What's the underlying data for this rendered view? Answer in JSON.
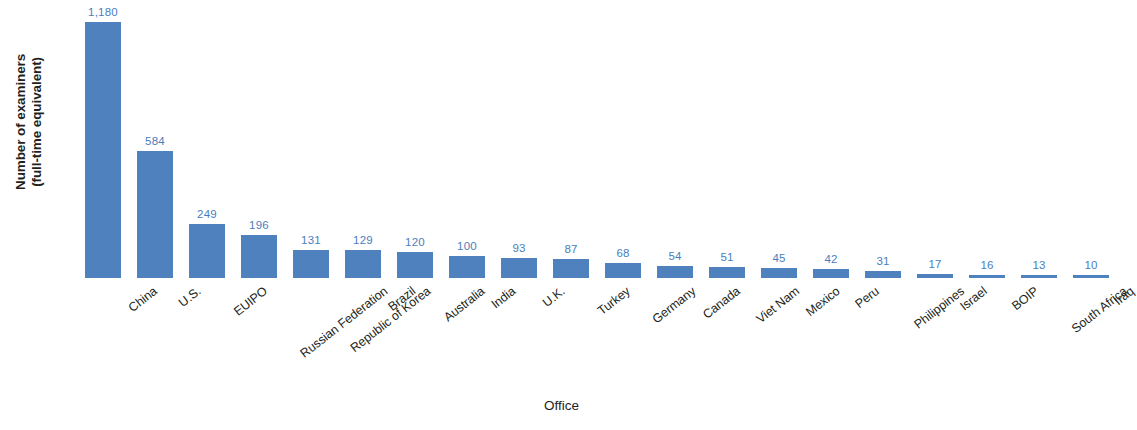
{
  "chart_data": {
    "type": "bar",
    "title": "",
    "xlabel": "Office",
    "ylabel": "Number of examiners\n(full-time equivalent)",
    "ylim": [
      0,
      1180
    ],
    "grid": false,
    "legend": "none",
    "axis_line": false,
    "bar_color": "#4e81bd",
    "label_color": "#4a7ebb",
    "categories": [
      "China",
      "U.S.",
      "EUIPO",
      "Russian Federation",
      "Republic of Korea",
      "Brazil",
      "Australia",
      "India",
      "U.K.",
      "Turkey",
      "Germany",
      "Canada",
      "Viet Nam",
      "Mexico",
      "Peru",
      "Philippines",
      "Israel",
      "BOIP",
      "South Africa",
      "Iraq"
    ],
    "values": [
      1180,
      584,
      249,
      196,
      131,
      129,
      120,
      100,
      93,
      87,
      68,
      54,
      51,
      45,
      42,
      31,
      17,
      16,
      13,
      10
    ],
    "value_labels": [
      "1,180",
      "584",
      "249",
      "196",
      "131",
      "129",
      "120",
      "100",
      "93",
      "87",
      "68",
      "54",
      "51",
      "45",
      "42",
      "31",
      "17",
      "16",
      "13",
      "10"
    ]
  }
}
